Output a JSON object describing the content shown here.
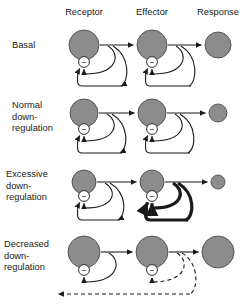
{
  "figure": {
    "colors": {
      "node_fill": "#8c8c8c",
      "node_stroke": "#4d4d4d",
      "minus_fill": "#ffffff",
      "minus_stroke": "#1a1a1a",
      "arrow": "#1a1a1a",
      "background": "#ffffff"
    }
  },
  "columns": [
    {
      "id": "receptor",
      "label": "Receptor",
      "x": 84
    },
    {
      "id": "effector",
      "label": "Effector",
      "x": 152
    },
    {
      "id": "response",
      "label": "Response",
      "x": 218
    }
  ],
  "rows": [
    {
      "id": "basal",
      "label_lines": [
        "Basal"
      ],
      "label_x": 12,
      "label_y": 48,
      "center_y": 45,
      "receptor": {
        "radius": 15,
        "minus": "−",
        "feedback": "solid",
        "loops": [
          "short",
          "long"
        ]
      },
      "effector": {
        "radius": 15,
        "minus": "−",
        "feedback": "solid",
        "loops": [
          "short",
          "long"
        ]
      },
      "response": {
        "radius": 13
      }
    },
    {
      "id": "normal-down-regulation",
      "label_lines": [
        "Normal",
        "down-",
        "regulation"
      ],
      "label_x": 12,
      "label_y": 108,
      "center_y": 113,
      "receptor": {
        "radius": 14,
        "minus": "−",
        "feedback": "solid",
        "loops": [
          "short",
          "long"
        ]
      },
      "effector": {
        "radius": 14,
        "minus": "−",
        "feedback": "solid",
        "loops": [
          "short",
          "long"
        ]
      },
      "response": {
        "radius": 9
      }
    },
    {
      "id": "excessive-down-regulation",
      "label_lines": [
        "Excessive",
        "down-",
        "regulation"
      ],
      "label_x": 6,
      "label_y": 177,
      "center_y": 182,
      "receptor": {
        "radius": 12,
        "minus": "−",
        "feedback": "solid",
        "loops": [
          "short",
          "long"
        ]
      },
      "effector": {
        "radius": 12,
        "minus": "−",
        "feedback": "bold",
        "loops": [
          "short",
          "long"
        ]
      },
      "response": {
        "radius": 7
      }
    },
    {
      "id": "decreased-down-regulation",
      "label_lines": [
        "Decreased",
        "down-",
        "regulation"
      ],
      "label_x": 4,
      "label_y": 247,
      "center_y": 252,
      "receptor": {
        "radius": 16,
        "minus": "−",
        "feedback": "solid",
        "loops": [
          "short"
        ]
      },
      "effector": {
        "radius": 16,
        "minus": "−",
        "feedback": "dashed",
        "loops": [
          "short",
          "long"
        ]
      },
      "response": {
        "radius": 16
      }
    }
  ]
}
